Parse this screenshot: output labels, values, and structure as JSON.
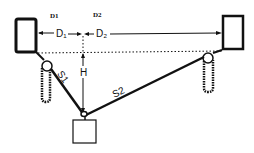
{
  "diagram": {
    "header_labels": {
      "d1": "D1",
      "d2": "D2"
    },
    "dimension_labels": {
      "d1": "D₁",
      "d2": "D₂",
      "h": "H"
    },
    "segment_labels": {
      "s1": "S1",
      "s2": "S2"
    },
    "elements": [
      "left-support-block",
      "right-support-block",
      "left-pulley-chain",
      "right-pulley-chain",
      "suspended-weight",
      "reference-dotted-line"
    ],
    "colors": {
      "stroke": "#111111",
      "background": "#ffffff"
    }
  }
}
